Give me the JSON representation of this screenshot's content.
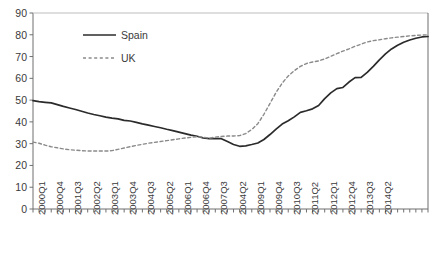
{
  "chart_data": {
    "type": "line",
    "title": "",
    "subtitle": "",
    "xlabel": "",
    "ylabel": "",
    "ylim": [
      0,
      90
    ],
    "ytick_step": 10,
    "yticks": [
      0,
      10,
      20,
      30,
      40,
      50,
      60,
      70,
      80,
      90
    ],
    "grid": false,
    "legend_position": "top-left",
    "x_tick_interval_quarters": 1,
    "x_label_interval_quarters": 3,
    "categories": [
      "2000Q1",
      "2000Q2",
      "2000Q3",
      "2000Q4",
      "2001Q1",
      "2001Q2",
      "2001Q3",
      "2001Q4",
      "2002Q1",
      "2002Q2",
      "2002Q3",
      "2002Q4",
      "2003Q1",
      "2003Q2",
      "2003Q3",
      "2003Q4",
      "2004Q1",
      "2004Q2",
      "2004Q3",
      "2004Q4",
      "2005Q1",
      "2005Q2",
      "2005Q3",
      "2005Q4",
      "2006Q1",
      "2006Q2",
      "2006Q3",
      "2006Q4",
      "2007Q1",
      "2007Q2",
      "2007Q3",
      "2007Q4",
      "2004Q2",
      "2008Q3",
      "2008Q4",
      "2009Q1",
      "2009Q2",
      "2009Q3",
      "2009Q4",
      "2010Q1",
      "2010Q2",
      "2010Q3",
      "2010Q4",
      "2011Q1",
      "2011Q2",
      "2011Q3",
      "2011Q4",
      "2012Q1",
      "2012Q2",
      "2012Q3",
      "2012Q4",
      "2013Q1",
      "2013Q2",
      "2013Q3",
      "2013Q4",
      "2014Q1",
      "2014Q2",
      "2014Q3",
      "2014Q4"
    ],
    "xtick_labels": [
      "2000Q1",
      "2000Q4",
      "2001Q3",
      "2002Q2",
      "2003Q1",
      "2003Q4",
      "2004Q3",
      "2005Q2",
      "2006Q1",
      "2006Q4",
      "2007Q3",
      "2004Q2",
      "2009Q1",
      "2009Q4",
      "2010Q3",
      "2011Q2",
      "2012Q1",
      "2012Q4",
      "2013Q3",
      "2014Q2"
    ],
    "series": [
      {
        "name": "Spain",
        "style": "solid",
        "color": "#2b2b2b",
        "values": [
          49.8,
          49.3,
          49.0,
          48.7,
          47.9,
          47.1,
          46.4,
          45.7,
          44.9,
          44.1,
          43.4,
          42.8,
          42.2,
          41.7,
          41.4,
          40.7,
          40.4,
          39.8,
          39.1,
          38.5,
          37.9,
          37.3,
          36.6,
          36.0,
          35.3,
          34.6,
          33.9,
          33.4,
          32.6,
          32.3,
          32.3,
          32.3,
          31.0,
          29.6,
          28.8,
          29.0,
          29.6,
          30.3,
          31.9,
          34.2,
          36.7,
          39.0,
          40.5,
          42.3,
          44.4,
          45.1,
          46.0,
          47.5,
          50.7,
          53.3,
          55.3,
          55.8,
          58.3,
          60.3,
          60.4,
          62.7,
          65.5,
          68.5,
          71.2
        ]
      },
      {
        "name": "UK",
        "style": "dashed",
        "color": "#8a8a8a",
        "values": [
          30.7,
          30.2,
          29.3,
          28.6,
          28.1,
          27.6,
          27.2,
          27.0,
          26.8,
          26.6,
          26.6,
          26.6,
          26.6,
          26.8,
          27.4,
          28.0,
          28.6,
          29.2,
          29.7,
          30.2,
          30.6,
          31.0,
          31.4,
          31.8,
          32.2,
          32.6,
          32.9,
          33.2,
          33.0,
          32.5,
          33.0,
          33.3,
          33.5,
          33.5,
          33.7,
          34.6,
          36.5,
          39.2,
          43.5,
          48.5,
          53.5,
          57.8,
          61.1,
          63.5,
          65.5,
          66.8,
          67.5,
          68.0,
          68.9,
          70.1,
          71.3,
          72.5,
          73.5,
          74.7,
          75.7,
          76.7,
          77.3,
          77.7,
          78.2
        ]
      }
    ],
    "series_tail": {
      "Spain": [
        73.5,
        75.2,
        76.6,
        77.6,
        78.4,
        79.0,
        79.2
      ],
      "UK": [
        78.6,
        78.9,
        79.2,
        79.5,
        79.7,
        79.9,
        80.0
      ]
    },
    "legend": [
      {
        "label": "Spain",
        "style": "solid",
        "color": "#2b2b2b"
      },
      {
        "label": "UK",
        "style": "dashed",
        "color": "#8a8a8a"
      }
    ]
  }
}
